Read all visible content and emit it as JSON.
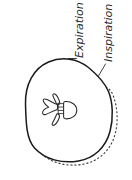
{
  "figure": {
    "background_color": "#ffffff",
    "width": 132,
    "height": 180,
    "orientation": "labels rotated 90 degrees counter-clockwise"
  },
  "labels": [
    {
      "id": "expiration",
      "text": "Expiration",
      "line_style": "dashed",
      "color": "#2b2b2b",
      "leader": "vertical tick down to dashed outline"
    },
    {
      "id": "inspiration",
      "text": "Inspiration",
      "line_style": "solid",
      "color": "#2b2b2b",
      "leader": "diagonal line down-left to solid outline"
    }
  ],
  "anatomy": {
    "body_outline_solid": {
      "name": "chest-wall-inspiration-outline",
      "stroke_color": "#1a1a1a",
      "fill_color": "#ffffff"
    },
    "body_outline_dashed": {
      "name": "chest-wall-expiration-outline",
      "stroke_color": "#3a3a3a"
    },
    "vertebra": {
      "name": "vertebra",
      "parts": [
        "vertebral-body",
        "spinous-process",
        "transverse-process-superior",
        "transverse-process-inferior",
        "vertebral-foramen"
      ],
      "stroke_color": "#2a2a2a",
      "fill_color": "#ffffff"
    }
  }
}
